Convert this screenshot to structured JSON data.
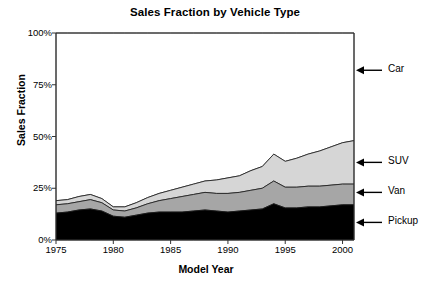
{
  "chart_data": {
    "type": "area",
    "stacked": true,
    "title": "Sales Fraction by Vehicle Type",
    "xlabel": "Model Year",
    "ylabel": "Sales Fraction",
    "xlim": [
      1975,
      2001
    ],
    "ylim": [
      0,
      100
    ],
    "xticks": [
      1975,
      1980,
      1985,
      1990,
      1995,
      2000
    ],
    "xtick_labels": [
      "1975",
      "1980",
      "1985",
      "1990",
      "1995",
      "2000"
    ],
    "yticks": [
      0,
      25,
      50,
      75,
      100
    ],
    "ytick_labels": [
      "0%",
      "25%",
      "50%",
      "75%",
      "100%"
    ],
    "grid": false,
    "legend_position": "right-annotations",
    "x": [
      1975,
      1976,
      1977,
      1978,
      1979,
      1980,
      1981,
      1982,
      1983,
      1984,
      1985,
      1986,
      1987,
      1988,
      1989,
      1990,
      1991,
      1992,
      1993,
      1994,
      1995,
      1996,
      1997,
      1998,
      1999,
      2000,
      2001
    ],
    "series": [
      {
        "name": "Pickup",
        "color": "#000000",
        "values": [
          13.0,
          13.5,
          14.5,
          15.0,
          14.0,
          11.5,
          11.0,
          12.0,
          13.0,
          13.5,
          13.5,
          13.5,
          14.0,
          14.5,
          14.0,
          13.5,
          14.0,
          14.5,
          15.0,
          17.5,
          15.5,
          15.5,
          16.0,
          16.0,
          16.5,
          17.0,
          17.0
        ]
      },
      {
        "name": "Van",
        "color": "#a6a6a6",
        "values": [
          4.0,
          4.0,
          4.0,
          4.5,
          4.0,
          3.0,
          3.0,
          3.5,
          4.5,
          5.5,
          6.5,
          7.5,
          8.0,
          8.5,
          8.5,
          9.0,
          9.0,
          9.5,
          10.0,
          11.0,
          10.0,
          10.0,
          10.0,
          10.0,
          10.0,
          10.0,
          10.0
        ]
      },
      {
        "name": "SUV",
        "color": "#d6d6d6",
        "values": [
          2.0,
          2.0,
          2.5,
          2.5,
          2.0,
          1.5,
          2.0,
          2.5,
          3.0,
          3.5,
          4.0,
          4.5,
          5.0,
          5.5,
          6.5,
          7.5,
          8.0,
          9.5,
          10.5,
          13.0,
          12.5,
          14.0,
          15.5,
          17.0,
          18.5,
          20.0,
          21.0
        ]
      },
      {
        "name": "Car",
        "color": "#ffffff",
        "values": [
          81.0,
          80.5,
          79.0,
          78.0,
          80.0,
          84.0,
          84.0,
          82.0,
          79.5,
          77.5,
          76.0,
          74.5,
          73.0,
          71.5,
          71.0,
          70.0,
          69.0,
          66.5,
          64.5,
          58.5,
          62.0,
          60.5,
          58.5,
          57.0,
          55.0,
          53.0,
          52.0
        ]
      }
    ],
    "annotations": [
      {
        "label": "Car",
        "y_pct": 82.0
      },
      {
        "label": "SUV",
        "y_pct": 37.5
      },
      {
        "label": "Van",
        "y_pct": 23.0
      },
      {
        "label": "Pickup",
        "y_pct": 8.5
      }
    ]
  }
}
